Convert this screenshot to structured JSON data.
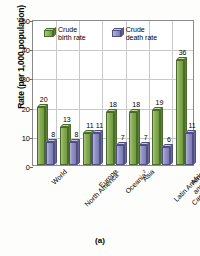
{
  "chart_data": {
    "type": "bar",
    "title": "",
    "caption": "(a)",
    "xlabel": "",
    "ylabel": "Rate (per 1,000 population)",
    "ylim": [
      0,
      50
    ],
    "yticks": [
      0,
      10,
      20,
      30,
      40,
      50
    ],
    "grid": true,
    "legend_position": "top-inside",
    "categories": [
      "World",
      "North America",
      "Europe",
      "Oceania",
      "Asia",
      "Latin America and the Caribbean",
      "Africa"
    ],
    "category_superscripts": [
      "",
      "1",
      "",
      "2",
      "",
      "",
      ""
    ],
    "series": [
      {
        "name": "Crude birth rate",
        "color": "#7fa94f",
        "values": [
          20,
          13,
          11,
          18,
          18,
          19,
          36
        ]
      },
      {
        "name": "Crude death rate",
        "color": "#8b8bc0",
        "values": [
          8,
          8,
          11,
          7,
          7,
          6,
          11
        ]
      }
    ]
  },
  "legend": {
    "items": [
      {
        "label_line1": "Crude",
        "label_line2": "birth rate",
        "swatch": "green"
      },
      {
        "label_line1": "Crude",
        "label_line2": "death rate",
        "swatch": "purple"
      }
    ]
  }
}
